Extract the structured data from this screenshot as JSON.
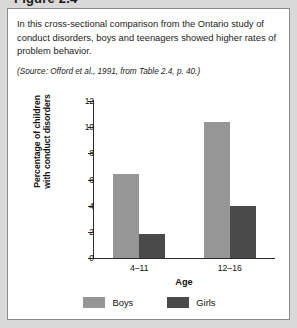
{
  "figure": {
    "title_partial": "Figure 2.4",
    "caption": "In this cross-sectional comparison from the Ontario study of conduct disorders, boys and teenagers showed higher rates of problem behavior.",
    "source": "(Source: Offord et al., 1991, from Table 2.4, p. 40.)"
  },
  "colors": {
    "boys": "#969696",
    "girls": "#4a4a4a",
    "axis": "#2b2b2b",
    "page_background": "#d9d9d9",
    "panel_background": "#ffffff",
    "panel_border": "#8c8c8c"
  },
  "chart_data": {
    "type": "bar",
    "title": "",
    "xlabel": "Age",
    "ylabel": "Percentage of children with conduct disorders",
    "ylabel_line1": "Percentage of children",
    "ylabel_line2": "with conduct disorders",
    "categories": [
      "4–11",
      "12–16"
    ],
    "series": [
      {
        "name": "Boys",
        "color": "#969696",
        "values": [
          6.4,
          10.4
        ]
      },
      {
        "name": "Girls",
        "color": "#4a4a4a",
        "values": [
          1.8,
          4.0
        ]
      }
    ],
    "ylim": [
      0,
      12
    ],
    "yticks": [
      0,
      2,
      4,
      6,
      8,
      10,
      12
    ],
    "ytick_labels": [
      "0",
      "2",
      "4",
      "6",
      "8",
      "10",
      "12"
    ],
    "grid": false,
    "legend_position": "bottom-center"
  }
}
